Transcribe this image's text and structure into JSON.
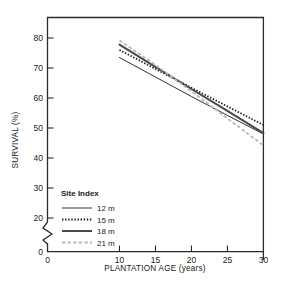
{
  "chart_data": {
    "type": "line",
    "title": "",
    "xlabel": "PLANTATION AGE (years)",
    "ylabel": "SURVIVAL (%)",
    "xlim": [
      0,
      30
    ],
    "ylim": [
      0,
      85
    ],
    "xticks": [
      0,
      10,
      15,
      20,
      25,
      30
    ],
    "yticks": [
      0,
      20,
      30,
      40,
      50,
      60,
      70,
      80
    ],
    "grid": false,
    "axis_break": {
      "axis": "y",
      "between": [
        0,
        20
      ],
      "style": "zigzag"
    },
    "legend": {
      "title": "Site Index",
      "position": "lower-left-inside"
    },
    "x": [
      10,
      15,
      20,
      25,
      30
    ],
    "series": [
      {
        "name": "12 m",
        "label": "12 m",
        "style": "solid-thin",
        "color": "#303030",
        "width": 1.0,
        "dash": "",
        "values": [
          73.5,
          67.0,
          60.5,
          54.2,
          48.0
        ]
      },
      {
        "name": "15 m",
        "label": "15 m",
        "style": "dotted",
        "color": "#1a1a1a",
        "width": 1.8,
        "dash": "1.4,1.7",
        "values": [
          76.0,
          69.7,
          63.4,
          57.2,
          51.0
        ]
      },
      {
        "name": "18 m",
        "label": "18 m",
        "style": "solid-thick",
        "color": "#4a4a4a",
        "width": 2.0,
        "dash": "",
        "values": [
          77.8,
          70.4,
          63.0,
          55.7,
          48.3
        ]
      },
      {
        "name": "21 m",
        "label": "21 m",
        "style": "dashed",
        "color": "#b9b9b9",
        "width": 1.8,
        "dash": "3.4,2.2",
        "values": [
          79.2,
          71.0,
          62.2,
          53.2,
          44.2
        ]
      }
    ]
  },
  "colors": {
    "axis": "#2b2b2b",
    "background": "#ffffff",
    "text": "#1a1a1a"
  }
}
